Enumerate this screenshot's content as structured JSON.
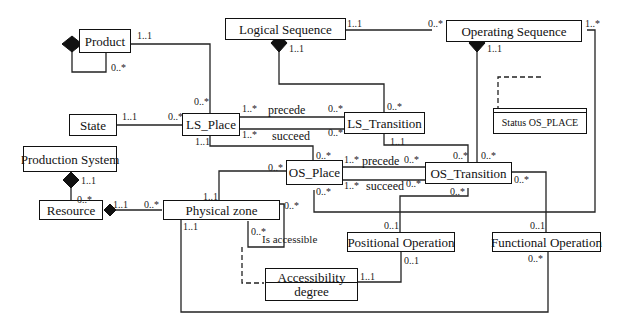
{
  "diagram": {
    "type": "UML class diagram",
    "classes": {
      "product": "Product",
      "logical_sequence": "Logical Sequence",
      "operating_sequence": "Operating Sequence",
      "state": "State",
      "ls_place": "LS_Place",
      "ls_transition": "LS_Transition",
      "status_os_place": "Status OS_PLACE",
      "production_system": "Production System",
      "resource": "Resource",
      "physical_zone": "Physical zone",
      "os_place": "OS_Place",
      "os_transition": "OS_Transition",
      "positional_operation": "Positional Operation",
      "functional_operation": "Functional Operation",
      "accessibility_degree_line1": "Accessibility",
      "accessibility_degree_line2": "degree"
    },
    "roles": {
      "ls_precede": "precede",
      "ls_succeed": "succeed",
      "os_precede": "precede",
      "os_succeed": "succeed",
      "is_accessible": "Is accessible"
    },
    "multiplicities": {
      "product_to_lsplace_src": "1..1",
      "product_self": "0..*",
      "product_to_lsplace_dst": "0..*",
      "logseq_to_opseq_src": "1..1",
      "logseq_to_opseq_dst": "0..*",
      "opseq_right": "1..*",
      "logseq_comp": "1..1",
      "opseq_comp": "1..1",
      "state_to_lsplace_src": "1..1",
      "state_to_lsplace_dst": "0..*",
      "lsplace_precede_src": "1..*",
      "lsplace_precede_dst": "0..*",
      "lsplace_succeed_src": "1..*",
      "lsplace_succeed_dst": "0..*",
      "lstrans_top": "0..*",
      "lstrans_bottom": "1..1",
      "lsplace_bottom": "1..1",
      "osplace_top": "0..*",
      "osplace_left": "0..*",
      "osplace_bottom": "0..*",
      "osplace_precede_src": "1..*",
      "osplace_precede_dst": "0..*",
      "osplace_succeed_src": "1..*",
      "osplace_succeed_dst": "0..*",
      "ostrans_top_left": "0..*",
      "ostrans_top_right": "0..*",
      "ostrans_right": "0..*",
      "ostrans_bottom": "0..*",
      "prodsys_comp": "1..1",
      "resource_top": "0..*",
      "resource_to_pz_src": "1..1",
      "resource_to_pz_dst": "0..*",
      "pz_top": "1..1",
      "pz_right": "0..*",
      "pz_bottom": "1..1",
      "pz_accessible": "0..*",
      "posop_top": "0..1",
      "posop_bottom": "0..1",
      "funcop_top": "0..1",
      "funcop_bottom": "0..*",
      "accdeg_right": "1..1"
    }
  }
}
